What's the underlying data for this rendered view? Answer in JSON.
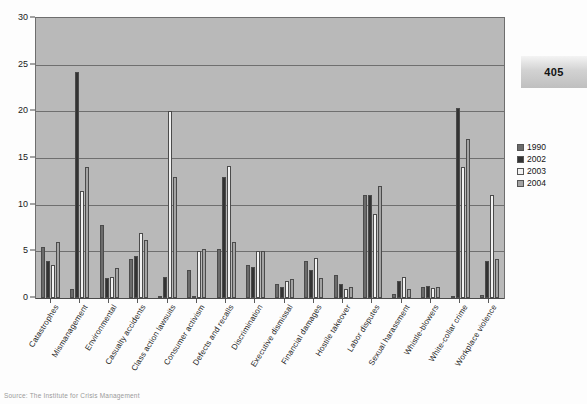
{
  "page": {
    "number": "405",
    "source_note": "Source: The Institute for Crisis Management"
  },
  "legend": {
    "items": [
      {
        "label": "1990",
        "color": "#6b6b6b"
      },
      {
        "label": "2002",
        "color": "#333333"
      },
      {
        "label": "2003",
        "color": "#f2f2f2"
      },
      {
        "label": "2004",
        "color": "#a3a3a3"
      }
    ]
  },
  "chart_data": {
    "type": "bar",
    "title": "",
    "subtitle": "",
    "xlabel": "",
    "ylabel": "",
    "ylim": [
      0,
      30
    ],
    "yticks": [
      0,
      5,
      10,
      15,
      20,
      25,
      30
    ],
    "grid": true,
    "legend_position": "right",
    "categories": [
      "Catastrophes",
      "Mismanagement",
      "Environmental",
      "Casualty accidents",
      "Class action lawsuits",
      "Consumer activism",
      "Defects and recalls",
      "Discrimination",
      "Executive dismissal",
      "Financial damages",
      "Hostile takeover",
      "Labor disputes",
      "Sexual harassment",
      "Whistle-blowers",
      "White-collar crime",
      "Workplace violence"
    ],
    "series": [
      {
        "name": "1990",
        "color": "#6b6b6b",
        "values": [
          5.5,
          1.0,
          7.8,
          4.2,
          0.2,
          3.0,
          5.2,
          3.5,
          1.5,
          4.0,
          2.5,
          11.0,
          0.4,
          1.2,
          0.2,
          0.3
        ]
      },
      {
        "name": "2002",
        "color": "#333333",
        "values": [
          4.0,
          24.2,
          2.1,
          4.5,
          2.2,
          0.2,
          13.0,
          3.3,
          1.2,
          3.0,
          1.5,
          11.0,
          1.8,
          1.3,
          20.4,
          4.0
        ]
      },
      {
        "name": "2003",
        "color": "#f2f2f2",
        "values": [
          3.5,
          11.5,
          2.2,
          7.0,
          20.0,
          5.0,
          14.1,
          5.0,
          1.8,
          4.3,
          1.0,
          9.0,
          2.2,
          1.1,
          14.0,
          11.0
        ]
      },
      {
        "name": "2004",
        "color": "#a3a3a3",
        "values": [
          6.0,
          14.0,
          3.2,
          6.2,
          13.0,
          5.2,
          6.0,
          5.0,
          2.0,
          2.1,
          1.2,
          12.0,
          1.0,
          1.2,
          17.0,
          4.2
        ]
      }
    ]
  }
}
